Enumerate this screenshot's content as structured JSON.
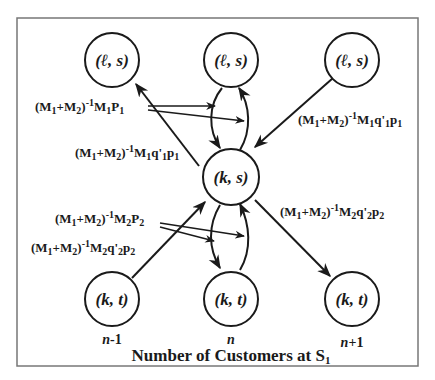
{
  "diagram": {
    "title_main": "Number of Customers at S",
    "title_sub": "1",
    "nodes": [
      {
        "id": "top-left",
        "label": "(ℓ, s)"
      },
      {
        "id": "top-center",
        "label": "(ℓ, s)"
      },
      {
        "id": "top-right",
        "label": "(ℓ, s)"
      },
      {
        "id": "center",
        "label": "(k, s)"
      },
      {
        "id": "bottom-left",
        "label": "(k, t)"
      },
      {
        "id": "bottom-center",
        "label": "(k, t)"
      },
      {
        "id": "bottom-right",
        "label": "(k, t)"
      }
    ],
    "column_labels": [
      "n-1",
      "n",
      "n+1"
    ],
    "rates": {
      "r1": {
        "prefix": "(M",
        "s1": "1",
        "plus": "+M",
        "s2": "2",
        "close": ")",
        "exp": "-1",
        "tail": "M",
        "t1": "1",
        "tail2": "P",
        "t2": "1",
        "text": "(M1+M2)^-1 M1P1"
      },
      "r2": {
        "text": "(M1+M2)^-1 M1q'1p1"
      },
      "r3": {
        "text": "(M1+M2)^-1 M1q'1p1"
      },
      "r4": {
        "text": "(M1+M2)^-1 M2P2"
      },
      "r5": {
        "text": "(M1+M2)^-1 M2q'2p2"
      },
      "r6": {
        "text": "(M1+M2)^-1 M2q'2p2"
      }
    }
  }
}
